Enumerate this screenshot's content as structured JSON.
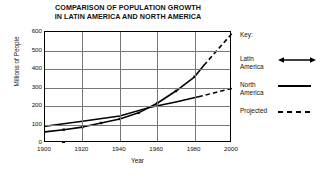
{
  "chart_data": {
    "type": "line",
    "title": "COMPARISON OF POPULATION GROWTH IN LATIN AMERICA AND NORTH AMERICA",
    "title_lines": [
      "COMPARISON OF POPULATION GROWTH",
      "IN LATIN AMERICA AND NORTH AMERICA"
    ],
    "xlabel": "Year",
    "ylabel": "Millions of People",
    "xlim": [
      1900,
      2000
    ],
    "ylim": [
      0,
      600
    ],
    "xticks": [
      1900,
      1920,
      1940,
      1960,
      1980,
      2000
    ],
    "yticks": [
      0,
      100,
      200,
      300,
      400,
      500,
      600
    ],
    "grid": "both",
    "legend_position": "right",
    "series": [
      {
        "name": "Latin America",
        "style": "solid-with-markers",
        "projected_style": "dashed",
        "x": [
          1900,
          1910,
          1920,
          1930,
          1940,
          1950,
          1960,
          1970,
          1980,
          1985
        ],
        "values": [
          60,
          72,
          86,
          108,
          130,
          163,
          215,
          281,
          358,
          420
        ],
        "projected_x": [
          1985,
          1990,
          2000
        ],
        "projected_values": [
          420,
          478,
          592
        ]
      },
      {
        "name": "North America",
        "style": "solid",
        "projected_style": "dashed",
        "x": [
          1900,
          1920,
          1940,
          1955,
          1970,
          1982
        ],
        "values": [
          90,
          118,
          146,
          190,
          222,
          250
        ],
        "projected_x": [
          1982,
          2000
        ],
        "projected_values": [
          250,
          295
        ]
      }
    ],
    "annotations": []
  },
  "legend": {
    "title": "Key:",
    "entries": [
      {
        "label_line1": "Latin",
        "label_line2": "America",
        "sample": "line-with-arrow-markers"
      },
      {
        "label_line1": "North",
        "label_line2": "America",
        "sample": "solid-line"
      },
      {
        "label_line1": "Projected",
        "label_line2": "",
        "sample": "dashed-line"
      }
    ]
  },
  "axis": {
    "ytick_labels": [
      "600",
      "500",
      "400",
      "300",
      "200",
      "100",
      "0"
    ],
    "xtick_labels": [
      "1900",
      "1920",
      "1940",
      "1960",
      "1980",
      "2000"
    ]
  }
}
